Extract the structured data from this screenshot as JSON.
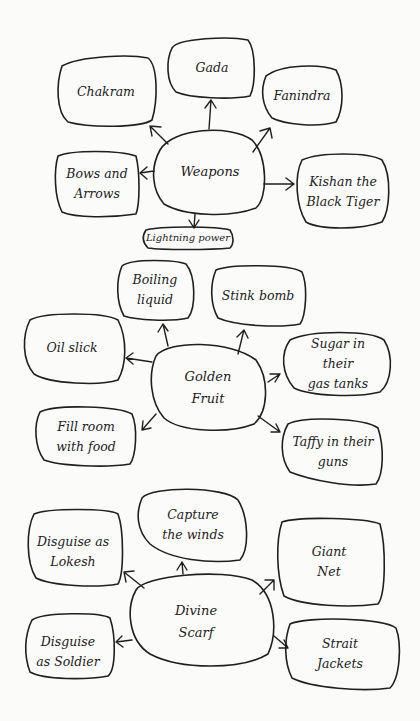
{
  "clusters": [
    {
      "center": {
        "label": "Weapons"
      },
      "nodes": [
        {
          "label": "Chakram"
        },
        {
          "label": "Gada"
        },
        {
          "label": "Fanindra"
        },
        {
          "label": "Bows and\nArrows"
        },
        {
          "label": "Kishan the\nBlack Tiger"
        },
        {
          "label": "Lightning power"
        }
      ]
    },
    {
      "center": {
        "label": "Golden\nFruit"
      },
      "nodes": [
        {
          "label": "Boiling\nliquid"
        },
        {
          "label": "Stink bomb"
        },
        {
          "label": "Oil slick"
        },
        {
          "label": "Sugar in their\ngas tanks"
        },
        {
          "label": "Fill room\nwith food"
        },
        {
          "label": "Taffy in their\nguns"
        }
      ]
    },
    {
      "center": {
        "label": "Divine\nScarf"
      },
      "nodes": [
        {
          "label": "Capture\nthe winds"
        },
        {
          "label": "Disguise as\nLokesh"
        },
        {
          "label": "Giant\nNet"
        },
        {
          "label": "Disguise\nas Soldier"
        },
        {
          "label": "Strait\nJackets"
        }
      ]
    }
  ],
  "colors": {
    "ink": "#1f1f1f",
    "paper": "#fbfbf9"
  }
}
